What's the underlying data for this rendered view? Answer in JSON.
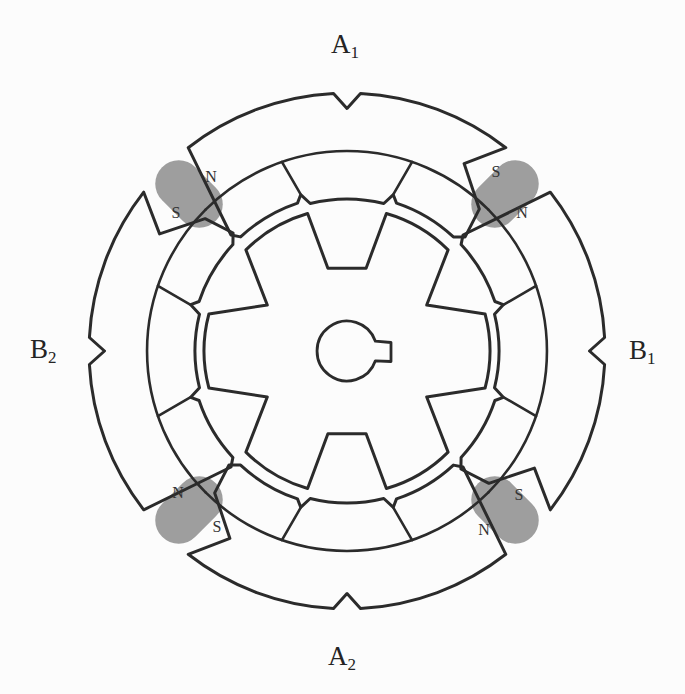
{
  "diagram": {
    "labels": {
      "top": {
        "base": "A",
        "sub": "1"
      },
      "bottom": {
        "base": "A",
        "sub": "2"
      },
      "right": {
        "base": "B",
        "sub": "1"
      },
      "left": {
        "base": "B",
        "sub": "2"
      }
    },
    "magnets": [
      {
        "corner": "top-left",
        "label_a": "N",
        "label_b": "S"
      },
      {
        "corner": "top-right",
        "label_a": "S",
        "label_b": "N"
      },
      {
        "corner": "bottom-left",
        "label_a": "N",
        "label_b": "S"
      },
      {
        "corner": "bottom-right",
        "label_a": "S",
        "label_b": "N"
      }
    ],
    "colors": {
      "ink": "#2b2b2b",
      "magnet": "#9e9e9e",
      "terminal": "#151515",
      "background": "#fcfcfc"
    }
  }
}
